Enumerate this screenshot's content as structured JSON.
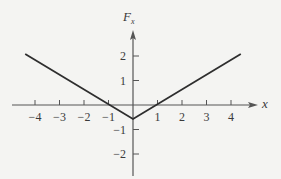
{
  "chart_data": {
    "type": "line",
    "title": "",
    "xlabel": "x",
    "ylabel": "F_x",
    "ylabel_main": "F",
    "ylabel_sub": "x",
    "xlim": [
      -4.8,
      4.8
    ],
    "ylim": [
      -2.8,
      3.0
    ],
    "grid": false,
    "legend": null,
    "x_ticks": [
      -4,
      -3,
      -2,
      -1,
      1,
      2,
      3,
      4
    ],
    "x_tick_labels": [
      "−4",
      "−3",
      "−2",
      "−1",
      "1",
      "2",
      "3",
      "4"
    ],
    "y_ticks": [
      2,
      1,
      -1,
      -2
    ],
    "y_tick_labels": [
      "2",
      "1",
      "−1",
      "−2"
    ],
    "series": [
      {
        "name": "F_x(x)",
        "x": [
          -4.4,
          0,
          4.4
        ],
        "y": [
          2.08,
          -0.57,
          2.08
        ],
        "color": "#2e2e2e"
      }
    ],
    "annotations": {
      "x_intercepts": [
        -1,
        1
      ],
      "vertex": [
        0,
        -0.57
      ]
    }
  },
  "colors": {
    "background": "#f4f4f2",
    "axis": "#555555",
    "line": "#2e2e2e",
    "text": "#3a3a3a"
  }
}
